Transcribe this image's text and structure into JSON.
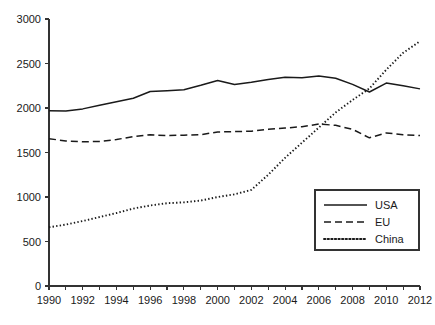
{
  "chart_data": {
    "type": "line",
    "title": "",
    "subtitle": "",
    "xlabel": "",
    "ylabel": "",
    "xlim": [
      1990,
      2012
    ],
    "ylim": [
      0,
      3000
    ],
    "grid": false,
    "legend_position": "bottom-right",
    "x": [
      1990,
      1991,
      1992,
      1993,
      1994,
      1995,
      1996,
      1997,
      1998,
      1999,
      2000,
      2001,
      2002,
      2003,
      2004,
      2005,
      2006,
      2007,
      2008,
      2009,
      2010,
      2011,
      2012
    ],
    "xticks": [
      1990,
      1991,
      1992,
      1993,
      1994,
      1995,
      1996,
      1997,
      1998,
      1999,
      2000,
      2001,
      2002,
      2003,
      2004,
      2005,
      2006,
      2007,
      2008,
      2009,
      2010,
      2011,
      2012
    ],
    "xtick_labels": [
      "1990",
      "",
      "1992",
      "",
      "1994",
      "",
      "1996",
      "",
      "1998",
      "",
      "2000",
      "",
      "2002",
      "",
      "2004",
      "",
      "2006",
      "",
      "2008",
      "",
      "2010",
      "",
      "2012"
    ],
    "yticks": [
      0,
      500,
      1000,
      1500,
      2000,
      2500,
      3000
    ],
    "ytick_labels": [
      "0",
      "500",
      "1000",
      "1500",
      "2000",
      "2500",
      "3000"
    ],
    "series": [
      {
        "name": "USA",
        "style": "solid",
        "color": "#1a1a1a",
        "values": [
          1970,
          1965,
          1990,
          2030,
          2070,
          2110,
          2185,
          2195,
          2205,
          2255,
          2310,
          2265,
          2290,
          2320,
          2345,
          2340,
          2360,
          2335,
          2265,
          2180,
          2280,
          2250,
          2215
        ]
      },
      {
        "name": "EU",
        "style": "dashed",
        "color": "#1a1a1a",
        "values": [
          1655,
          1630,
          1620,
          1625,
          1645,
          1680,
          1700,
          1690,
          1695,
          1700,
          1730,
          1735,
          1740,
          1760,
          1775,
          1790,
          1820,
          1805,
          1760,
          1665,
          1720,
          1700,
          1690
        ]
      },
      {
        "name": "China",
        "style": "dotted",
        "color": "#1a1a1a",
        "values": [
          660,
          690,
          730,
          775,
          820,
          870,
          905,
          930,
          940,
          960,
          1000,
          1030,
          1080,
          1250,
          1440,
          1610,
          1780,
          1950,
          2090,
          2220,
          2430,
          2620,
          2750
        ]
      }
    ]
  },
  "legend": {
    "entries": [
      {
        "label": "USA",
        "style": "solid"
      },
      {
        "label": "EU",
        "style": "dashed"
      },
      {
        "label": "China",
        "style": "dotted"
      }
    ]
  },
  "colors": {
    "ink": "#1a1a1a",
    "axis": "#333333",
    "background": "#ffffff"
  }
}
